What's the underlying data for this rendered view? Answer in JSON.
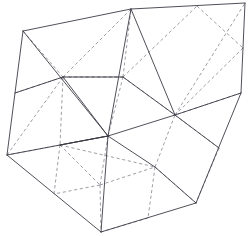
{
  "figure": {
    "kind": "line-drawing",
    "caption": "",
    "canvas": {
      "width": 250,
      "height": 237,
      "background": "#ffffff"
    },
    "style": {
      "visible_edge_color": "#3c3c46",
      "hidden_edge_color": "#8c8c96",
      "visible_edge_width": 0.9,
      "hidden_edge_width": 0.85,
      "hidden_dash_pattern": "3.2 2.6"
    },
    "vertices": {
      "top_left_corner": [
        23,
        31
      ],
      "top_apex": [
        131,
        9
      ],
      "top_right_corner": [
        245,
        3
      ],
      "right_upper": [
        243,
        48
      ],
      "right_mid": [
        241,
        93
      ],
      "bottom_right_corner": [
        196,
        203
      ],
      "bottom_apex": [
        101,
        232
      ],
      "left_lower": [
        7,
        155
      ],
      "face_center_upper_left": [
        63,
        77
      ],
      "face_center_upper_mid": [
        123,
        77
      ],
      "face_center_core": [
        108,
        136
      ],
      "face_center_right": [
        175,
        115
      ],
      "face_center_lower_right": [
        155,
        167
      ],
      "edge_mid_left_lower": [
        60,
        145
      ],
      "edge_mid_bottom_left": [
        100,
        185
      ],
      "top_edge_mid_left": [
        80,
        20
      ],
      "top_edge_mid_right": [
        197,
        6
      ],
      "right_edge_lower_mid": [
        219,
        148
      ],
      "left_edge_mid": [
        15,
        93
      ],
      "bottom_edge_mid": [
        148,
        218
      ],
      "bottom_edge_left_mid": [
        54,
        194
      ]
    },
    "edge_counts": {
      "solid": 24,
      "dashed": 29,
      "total": 53
    }
  },
  "geometry": {
    "solid_edges": [
      [
        [
          23,
          31
        ],
        [
          131,
          9
        ]
      ],
      [
        [
          131,
          9
        ],
        [
          245,
          3
        ]
      ],
      [
        [
          245,
          3
        ],
        [
          243,
          48
        ]
      ],
      [
        [
          243,
          48
        ],
        [
          241,
          93
        ]
      ],
      [
        [
          241,
          93
        ],
        [
          196,
          203
        ]
      ],
      [
        [
          196,
          203
        ],
        [
          101,
          232
        ]
      ],
      [
        [
          101,
          232
        ],
        [
          7,
          155
        ]
      ],
      [
        [
          7,
          155
        ],
        [
          23,
          31
        ]
      ],
      [
        [
          23,
          31
        ],
        [
          108,
          136
        ]
      ],
      [
        [
          108,
          136
        ],
        [
          175,
          115
        ]
      ],
      [
        [
          175,
          115
        ],
        [
          241,
          93
        ]
      ],
      [
        [
          131,
          9
        ],
        [
          108,
          136
        ]
      ],
      [
        [
          108,
          136
        ],
        [
          7,
          155
        ]
      ],
      [
        [
          108,
          136
        ],
        [
          155,
          167
        ]
      ],
      [
        [
          155,
          167
        ],
        [
          196,
          203
        ]
      ],
      [
        [
          108,
          136
        ],
        [
          101,
          232
        ]
      ],
      [
        [
          63,
          77
        ],
        [
          108,
          136
        ]
      ],
      [
        [
          123,
          77
        ],
        [
          175,
          115
        ]
      ],
      [
        [
          175,
          115
        ],
        [
          131,
          9
        ]
      ],
      [
        [
          60,
          145
        ],
        [
          108,
          136
        ]
      ],
      [
        [
          15,
          93
        ],
        [
          63,
          77
        ]
      ],
      [
        [
          63,
          77
        ],
        [
          123,
          77
        ]
      ],
      [
        [
          175,
          115
        ],
        [
          219,
          148
        ]
      ],
      [
        [
          108,
          136
        ],
        [
          60,
          145
        ]
      ]
    ],
    "dashed_edges": [
      [
        [
          23,
          31
        ],
        [
          63,
          77
        ]
      ],
      [
        [
          63,
          77
        ],
        [
          131,
          9
        ]
      ],
      [
        [
          63,
          77
        ],
        [
          123,
          77
        ]
      ],
      [
        [
          123,
          77
        ],
        [
          131,
          9
        ]
      ],
      [
        [
          123,
          77
        ],
        [
          175,
          115
        ]
      ],
      [
        [
          175,
          115
        ],
        [
          245,
          3
        ]
      ],
      [
        [
          197,
          6
        ],
        [
          243,
          48
        ]
      ],
      [
        [
          243,
          48
        ],
        [
          175,
          115
        ]
      ],
      [
        [
          63,
          77
        ],
        [
          7,
          155
        ]
      ],
      [
        [
          63,
          77
        ],
        [
          60,
          145
        ]
      ],
      [
        [
          60,
          145
        ],
        [
          7,
          155
        ]
      ],
      [
        [
          60,
          145
        ],
        [
          100,
          185
        ]
      ],
      [
        [
          100,
          185
        ],
        [
          101,
          232
        ]
      ],
      [
        [
          100,
          185
        ],
        [
          155,
          167
        ]
      ],
      [
        [
          155,
          167
        ],
        [
          175,
          115
        ]
      ],
      [
        [
          155,
          167
        ],
        [
          196,
          203
        ]
      ],
      [
        [
          155,
          167
        ],
        [
          148,
          218
        ]
      ],
      [
        [
          148,
          218
        ],
        [
          101,
          232
        ]
      ],
      [
        [
          60,
          145
        ],
        [
          155,
          167
        ]
      ],
      [
        [
          123,
          77
        ],
        [
          63,
          77
        ]
      ],
      [
        [
          175,
          115
        ],
        [
          219,
          148
        ]
      ],
      [
        [
          219,
          148
        ],
        [
          196,
          203
        ]
      ],
      [
        [
          15,
          93
        ],
        [
          63,
          77
        ]
      ],
      [
        [
          123,
          77
        ],
        [
          197,
          6
        ]
      ],
      [
        [
          100,
          185
        ],
        [
          54,
          194
        ]
      ],
      [
        [
          54,
          194
        ],
        [
          60,
          145
        ]
      ],
      [
        [
          108,
          136
        ],
        [
          123,
          77
        ]
      ],
      [
        [
          108,
          136
        ],
        [
          100,
          185
        ]
      ],
      [
        [
          241,
          93
        ],
        [
          175,
          115
        ]
      ]
    ]
  }
}
